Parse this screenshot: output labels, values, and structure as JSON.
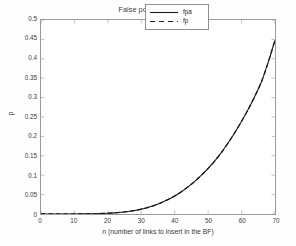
{
  "chart_data": {
    "type": "line",
    "title": "False positives estimate",
    "xlabel": "n (number of links to insert in the BF)",
    "ylabel": "p",
    "xlim": [
      0,
      70
    ],
    "ylim": [
      0,
      0.5
    ],
    "grid": false,
    "legend_position": "top-right-inside",
    "xticks": [
      0,
      10,
      20,
      30,
      40,
      50,
      60,
      70
    ],
    "xtick_labels": [
      "0",
      "10",
      "20",
      "30",
      "40",
      "50",
      "60",
      "70"
    ],
    "yticks": [
      0,
      0.05,
      0.1,
      0.15,
      0.2,
      0.25,
      0.3,
      0.35,
      0.4,
      0.45,
      0.5
    ],
    "ytick_labels": [
      "0",
      "0.05",
      "0.1",
      "0.15",
      "0.2",
      "0.25",
      "0.3",
      "0.35",
      "0.4",
      "0.45",
      "0.5"
    ],
    "x": [
      0,
      2,
      4,
      6,
      8,
      10,
      12,
      14,
      16,
      18,
      20,
      22,
      24,
      26,
      28,
      30,
      32,
      34,
      36,
      38,
      40,
      42,
      44,
      46,
      48,
      50,
      52,
      54,
      56,
      58,
      60,
      62,
      64,
      66,
      68,
      70
    ],
    "series": [
      {
        "name": "fpa",
        "style": "solid",
        "color": "#1a1a1a",
        "values": [
          0.0,
          0.0,
          0.0,
          0.0,
          0.0001,
          0.0002,
          0.0004,
          0.0008,
          0.0013,
          0.0021,
          0.0032,
          0.0047,
          0.0066,
          0.009,
          0.012,
          0.0156,
          0.0199,
          0.0249,
          0.0308,
          0.0375,
          0.0451,
          0.0536,
          0.0631,
          0.0736,
          0.0851,
          0.0977,
          0.1113,
          0.126,
          0.1418,
          0.1587,
          0.1767,
          0.1958,
          0.216,
          0.2374,
          0.2598,
          0.2834
        ]
      },
      {
        "name": "fp",
        "style": "dashed",
        "color": "#1a1a1a",
        "values": [
          0.0,
          0.0,
          0.0,
          0.0,
          0.0001,
          0.0002,
          0.0004,
          0.0008,
          0.0013,
          0.0021,
          0.0032,
          0.0047,
          0.0066,
          0.009,
          0.012,
          0.0156,
          0.0199,
          0.0249,
          0.0308,
          0.0375,
          0.0451,
          0.0536,
          0.0631,
          0.0736,
          0.0851,
          0.0977,
          0.1113,
          0.126,
          0.1418,
          0.1587,
          0.1767,
          0.1958,
          0.216,
          0.2374,
          0.2598,
          0.2834
        ]
      }
    ],
    "curve_points": {
      "x": [
        0,
        5,
        10,
        14,
        18,
        20,
        22,
        24,
        26,
        28,
        30,
        32,
        34,
        36,
        38,
        40,
        42,
        44,
        46,
        48,
        50,
        52,
        54,
        56,
        58,
        60,
        62,
        64,
        66,
        68,
        70
      ],
      "y": [
        0.0,
        0.0,
        0.0002,
        0.0006,
        0.0014,
        0.002,
        0.003,
        0.0044,
        0.0064,
        0.009,
        0.0125,
        0.017,
        0.0225,
        0.0292,
        0.0372,
        0.0465,
        0.0575,
        0.07,
        0.084,
        0.1,
        0.1175,
        0.137,
        0.159,
        0.1835,
        0.21,
        0.239,
        0.27,
        0.304,
        0.342,
        0.392,
        0.448
      ]
    }
  },
  "legend": {
    "entries": [
      {
        "label": "fpa",
        "style": "solid"
      },
      {
        "label": "fp",
        "style": "dashed"
      }
    ]
  }
}
